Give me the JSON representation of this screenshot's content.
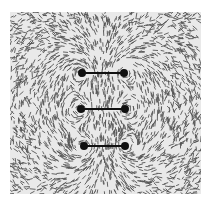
{
  "figure": {
    "frame": {
      "x": 10,
      "y": 12,
      "width": 191,
      "height": 182
    },
    "background_color": "#e9e9e9",
    "filing_color": "#222222",
    "conductor_color": "#111111",
    "conductors": [
      {
        "x1": 72,
        "x2": 114,
        "y": 61
      },
      {
        "x1": 71,
        "x2": 115,
        "y": 97
      },
      {
        "x1": 74,
        "x2": 115,
        "y": 134
      }
    ]
  }
}
